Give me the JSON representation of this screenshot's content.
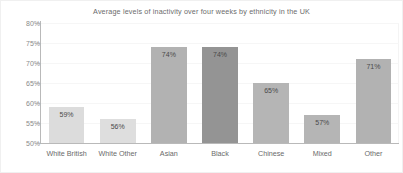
{
  "chart_data": {
    "type": "bar",
    "title": "Average levels of inactivity over four weeks by ethnicity in the UK",
    "xlabel": "",
    "ylabel": "",
    "categories": [
      "White British",
      "White Other",
      "Asian",
      "Black",
      "Chinese",
      "Mixed",
      "Other"
    ],
    "values": [
      59,
      56,
      74,
      74,
      65,
      57,
      71
    ],
    "value_labels": [
      "59%",
      "56%",
      "74%",
      "74%",
      "65%",
      "57%",
      "71%"
    ],
    "bar_colors": [
      "#dcdcdc",
      "#dedede",
      "#b2b2b2",
      "#949494",
      "#b5b5b5",
      "#b5b5b5",
      "#b2b2b2"
    ],
    "ylim": [
      50,
      80
    ],
    "y_ticks": [
      50,
      55,
      60,
      65,
      70,
      75,
      80
    ],
    "y_tick_labels": [
      "50%",
      "55%",
      "60%",
      "65%",
      "70%",
      "75%",
      "80%"
    ],
    "grid": true,
    "legend": "none",
    "axis_color": "#b9b9b9",
    "title_color": "#6c6c6c",
    "tick_label_color": "#8a8a8a",
    "category_label_color": "#6a6a6a",
    "value_label_color": "#4a4a4a",
    "background_color": "#ffffff"
  }
}
